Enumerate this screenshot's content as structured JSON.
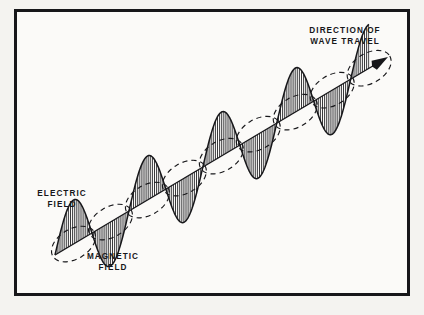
{
  "figure": {
    "background_color": "#f4f3f0",
    "paper_color": "#fbfaf8",
    "ink_color": "#17171a",
    "border": {
      "color": "#17171a",
      "thickness_px": 3,
      "x": 14,
      "y": 9,
      "width": 396,
      "height": 287
    },
    "labels": {
      "direction": {
        "line1": "DIRECTION OF",
        "line2": "WAVE TRAVEL"
      },
      "electric": {
        "line1": "ELECTRIC",
        "line2": "FIELD"
      },
      "magnetic": {
        "line1": "MAGNETIC",
        "line2": "FIELD"
      }
    }
  },
  "chart_data": {
    "type": "line",
    "xlabel": "",
    "ylabel": "",
    "grid": false,
    "legend_position": "none",
    "annotations": [
      {
        "text": "DIRECTION OF WAVE TRAVEL",
        "x": 345,
        "y": 33,
        "anchor": "middle"
      },
      {
        "text": "ELECTRIC FIELD",
        "x": 62,
        "y": 196,
        "anchor": "middle"
      },
      {
        "text": "MAGNETIC FIELD",
        "x": 113,
        "y": 258,
        "anchor": "middle"
      }
    ],
    "axis": {
      "name": "propagation axis",
      "start": [
        55,
        255
      ],
      "end": [
        388,
        57
      ],
      "angle_deg": -30.7,
      "arrow_head": true,
      "arrow_length": 16
    },
    "series": [
      {
        "name": "electric field",
        "style": "sine-hatched",
        "hatch": "vertical",
        "hatch_spacing_px": 2.1,
        "amplitude_px": 44,
        "wavelength_px": 86,
        "cycles": 3.9,
        "phase_deg": 0,
        "axis_length_px": 388
      },
      {
        "name": "magnetic field",
        "style": "dashed-ellipse",
        "dash": "5,4",
        "ellipse_count": 8,
        "ellipse_rx": 24,
        "ellipse_ry": 15,
        "spacing_px": 43
      }
    ]
  }
}
